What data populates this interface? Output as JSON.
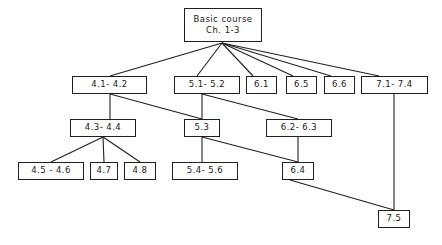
{
  "diagram": {
    "type": "hierarchy-tree",
    "colors": {
      "box_border": "#231f20",
      "box_fill": "#ffffff",
      "edge": "#231f20",
      "text": "#1a1718",
      "background": "#ffffff"
    },
    "nodes": [
      {
        "id": "root",
        "label": "Basic course",
        "label2": "Ch. 1-3",
        "x": 184,
        "y": 8,
        "w": 78,
        "h": 34,
        "level": 0
      },
      {
        "id": "n41_42",
        "label": "4.1- 4.2",
        "label2": "",
        "x": 72,
        "y": 76,
        "w": 75,
        "h": 18,
        "level": 1
      },
      {
        "id": "n51_52",
        "label": "5.1- 5.2",
        "label2": "",
        "x": 174,
        "y": 76,
        "w": 66,
        "h": 18,
        "level": 1
      },
      {
        "id": "n61",
        "label": "6.1",
        "label2": "",
        "x": 246,
        "y": 76,
        "w": 31,
        "h": 18,
        "level": 1
      },
      {
        "id": "n65",
        "label": "6.5",
        "label2": "",
        "x": 286,
        "y": 76,
        "w": 31,
        "h": 18,
        "level": 1
      },
      {
        "id": "n66",
        "label": "6.6",
        "label2": "",
        "x": 324,
        "y": 76,
        "w": 31,
        "h": 18,
        "level": 1
      },
      {
        "id": "n71_74",
        "label": "7.1- 7.4",
        "label2": "",
        "x": 361,
        "y": 76,
        "w": 67,
        "h": 18,
        "level": 1
      },
      {
        "id": "n43_44",
        "label": "4.3- 4.4",
        "label2": "",
        "x": 70,
        "y": 119,
        "w": 66,
        "h": 18,
        "level": 2
      },
      {
        "id": "n53",
        "label": "5.3",
        "label2": "",
        "x": 184,
        "y": 119,
        "w": 36,
        "h": 18,
        "level": 2
      },
      {
        "id": "n62_63",
        "label": "6.2- 6.3",
        "label2": "",
        "x": 266,
        "y": 119,
        "w": 66,
        "h": 18,
        "level": 2
      },
      {
        "id": "n45_46",
        "label": "4.5 - 4.6",
        "label2": "",
        "x": 18,
        "y": 162,
        "w": 66,
        "h": 18,
        "level": 3
      },
      {
        "id": "n47",
        "label": "4.7",
        "label2": "",
        "x": 90,
        "y": 162,
        "w": 28,
        "h": 18,
        "level": 3
      },
      {
        "id": "n48",
        "label": "4.8",
        "label2": "",
        "x": 124,
        "y": 162,
        "w": 32,
        "h": 18,
        "level": 3
      },
      {
        "id": "n54_56",
        "label": "5.4- 5.6",
        "label2": "",
        "x": 172,
        "y": 162,
        "w": 66,
        "h": 18,
        "level": 3
      },
      {
        "id": "n64",
        "label": "6.4",
        "label2": "",
        "x": 282,
        "y": 162,
        "w": 32,
        "h": 18,
        "level": 3
      },
      {
        "id": "n75",
        "label": "7.5",
        "label2": "",
        "x": 378,
        "y": 210,
        "w": 32,
        "h": 18,
        "level": 4
      }
    ],
    "edges": [
      {
        "from": "root",
        "to": "n41_42",
        "x1": 222,
        "y1": 43,
        "x2": 110,
        "y2": 76
      },
      {
        "from": "root",
        "to": "n51_52",
        "x1": 222,
        "y1": 43,
        "x2": 197,
        "y2": 76
      },
      {
        "from": "root",
        "to": "n61",
        "x1": 222,
        "y1": 43,
        "x2": 253,
        "y2": 76
      },
      {
        "from": "root",
        "to": "n65",
        "x1": 222,
        "y1": 43,
        "x2": 293,
        "y2": 76
      },
      {
        "from": "root",
        "to": "n66",
        "x1": 222,
        "y1": 43,
        "x2": 331,
        "y2": 76
      },
      {
        "from": "root",
        "to": "n71_74",
        "x1": 222,
        "y1": 43,
        "x2": 379,
        "y2": 76
      },
      {
        "from": "n41_42",
        "to": "n43_44",
        "x1": 110,
        "y1": 94,
        "x2": 110,
        "y2": 119
      },
      {
        "from": "n41_42",
        "to": "n53",
        "x1": 110,
        "y1": 94,
        "x2": 202,
        "y2": 119
      },
      {
        "from": "n51_52",
        "to": "n53",
        "x1": 202,
        "y1": 94,
        "x2": 202,
        "y2": 119
      },
      {
        "from": "n51_52",
        "to": "n62_63",
        "x1": 202,
        "y1": 94,
        "x2": 298,
        "y2": 119
      },
      {
        "from": "n71_74",
        "to": "n75",
        "x1": 394,
        "y1": 94,
        "x2": 394,
        "y2": 210
      },
      {
        "from": "n43_44",
        "to": "n45_46",
        "x1": 103,
        "y1": 137,
        "x2": 51,
        "y2": 162
      },
      {
        "from": "n43_44",
        "to": "n47",
        "x1": 103,
        "y1": 137,
        "x2": 104,
        "y2": 162
      },
      {
        "from": "n43_44",
        "to": "n48",
        "x1": 103,
        "y1": 137,
        "x2": 140,
        "y2": 162
      },
      {
        "from": "n53",
        "to": "n54_56",
        "x1": 202,
        "y1": 137,
        "x2": 202,
        "y2": 162
      },
      {
        "from": "n53",
        "to": "n64",
        "x1": 202,
        "y1": 137,
        "x2": 298,
        "y2": 162
      },
      {
        "from": "n62_63",
        "to": "n64",
        "x1": 298,
        "y1": 137,
        "x2": 298,
        "y2": 162
      },
      {
        "from": "n64",
        "to": "n75",
        "x1": 290,
        "y1": 180,
        "x2": 394,
        "y2": 210
      }
    ]
  }
}
